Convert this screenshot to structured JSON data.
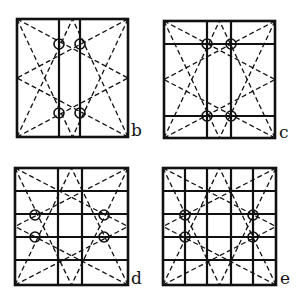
{
  "panels": [
    {
      "id": "b",
      "label": "b",
      "box": [
        17,
        19,
        128,
        137
      ],
      "verticals": [
        59,
        80
      ],
      "horizontals": [],
      "circles": [
        [
          59,
          44
        ],
        [
          80,
          44
        ],
        [
          59,
          113
        ],
        [
          80,
          113
        ]
      ],
      "label_pos": [
        131,
        122
      ]
    },
    {
      "id": "c",
      "label": "c",
      "box": [
        164,
        21,
        275,
        138
      ],
      "verticals": [
        207,
        231
      ],
      "horizontals": [
        44,
        116
      ],
      "circles": [
        [
          207,
          44
        ],
        [
          231,
          44
        ],
        [
          207,
          116
        ],
        [
          231,
          116
        ]
      ],
      "label_pos": [
        279,
        124
      ]
    },
    {
      "id": "d",
      "label": "d",
      "box": [
        15,
        168,
        128,
        285
      ],
      "verticals": [
        58,
        82
      ],
      "horizontals": [
        191,
        214,
        237,
        260
      ],
      "circles": [
        [
          35,
          215
        ],
        [
          104,
          215
        ],
        [
          35,
          237
        ],
        [
          104,
          237
        ]
      ],
      "label_pos": [
        131,
        271
      ]
    },
    {
      "id": "e",
      "label": "e",
      "box": [
        163,
        168,
        276,
        285
      ],
      "verticals": [
        185,
        207,
        231,
        253
      ],
      "horizontals": [
        191,
        214,
        237,
        260
      ],
      "circles": [
        [
          185,
          215
        ],
        [
          253,
          215
        ],
        [
          185,
          237
        ],
        [
          253,
          237
        ]
      ],
      "label_pos": [
        280,
        271
      ]
    }
  ],
  "style": {
    "stroke": "#111111",
    "background": "#ffffff"
  }
}
